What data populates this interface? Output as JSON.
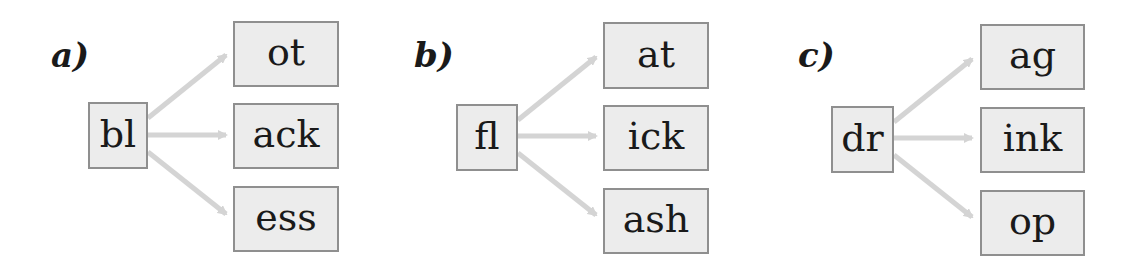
{
  "panels": [
    {
      "label": "a)",
      "source": "bl",
      "targets": [
        "ot",
        "ack",
        "ess"
      ]
    },
    {
      "label": "b)",
      "source": "fl",
      "targets": [
        "at",
        "ick",
        "ash"
      ]
    },
    {
      "label": "c)",
      "source": "dr",
      "targets": [
        "ag",
        "ink",
        "op"
      ]
    }
  ],
  "colors": {
    "box_fill": "#ececec",
    "box_border": "#8f8f8f",
    "arrow": "#d4d4d4",
    "text": "#1a1a1a"
  }
}
